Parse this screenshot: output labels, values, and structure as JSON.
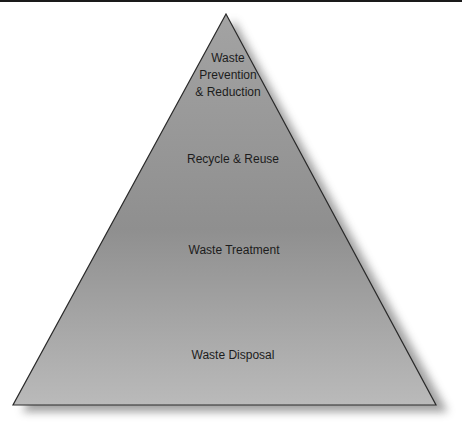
{
  "diagram": {
    "type": "pyramid",
    "levels": [
      {
        "label_lines": [
          "Waste",
          "Prevention",
          "& Reduction"
        ],
        "position": "top"
      },
      {
        "label": "Recycle & Reuse",
        "position": "upper-middle"
      },
      {
        "label": "Waste Treatment",
        "position": "lower-middle"
      },
      {
        "label": "Waste Disposal",
        "position": "bottom"
      }
    ],
    "colors": {
      "fill_top": "#a3a3a3",
      "fill_mid": "#8f8f8f",
      "fill_bottom": "#bababa",
      "outline": "#2a2a2a",
      "text": "#1c1c1c"
    }
  }
}
